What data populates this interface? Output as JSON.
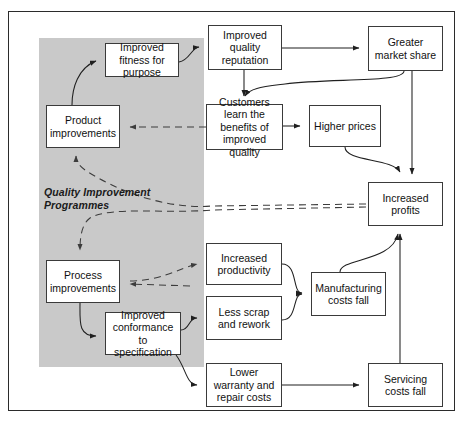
{
  "diagram": {
    "shaded_region_label": "Quality\nImprovement\nProgrammes",
    "shaded_region_label_lines": [
      "Quality",
      "Improvement",
      "Programmes"
    ],
    "colors": {
      "shaded_region": "#c9c9c9",
      "box_fill": "#ffffff",
      "box_border": "#3a3a3a",
      "frame_border": "#2b2b2b",
      "connector_solid": "#1f1f1f",
      "connector_dashed": "#3c3c3c"
    },
    "nodes": [
      {
        "id": "improved-fitness",
        "label": "Improved fitness for purpose",
        "lines": [
          "Improved fitness",
          "for purpose"
        ],
        "x": 105,
        "y": 43,
        "w": 74,
        "h": 34,
        "in_shaded_region": true
      },
      {
        "id": "product-improvements",
        "label": "Product improvements",
        "lines": [
          "Product",
          "improvements"
        ],
        "x": 46,
        "y": 105,
        "w": 74,
        "h": 43,
        "in_shaded_region": true
      },
      {
        "id": "process-improvements",
        "label": "Process improvements",
        "lines": [
          "Process",
          "improvements"
        ],
        "x": 46,
        "y": 260,
        "w": 74,
        "h": 43,
        "in_shaded_region": true
      },
      {
        "id": "improved-conformance",
        "label": "Improved conformance to specification",
        "lines": [
          "Improved",
          "conformance to",
          "specification"
        ],
        "x": 105,
        "y": 312,
        "w": 76,
        "h": 43,
        "in_shaded_region": true
      },
      {
        "id": "quality-reputation",
        "label": "Improved quality reputation",
        "lines": [
          "Improved",
          "quality",
          "reputation"
        ],
        "x": 208,
        "y": 25,
        "w": 74,
        "h": 45,
        "in_shaded_region": false
      },
      {
        "id": "customers-learn",
        "label": "Customers learn the benefits of improved quality",
        "lines": [
          "Customers learn",
          "the benefits of",
          "improved quality"
        ],
        "x": 206,
        "y": 104,
        "w": 77,
        "h": 46,
        "in_shaded_region": false
      },
      {
        "id": "higher-prices",
        "label": "Higher prices",
        "lines": [
          "Higher prices"
        ],
        "x": 309,
        "y": 105,
        "w": 72,
        "h": 42,
        "in_shaded_region": false
      },
      {
        "id": "greater-market-share",
        "label": "Greater market share",
        "lines": [
          "Greater",
          "market share"
        ],
        "x": 368,
        "y": 26,
        "w": 75,
        "h": 45,
        "in_shaded_region": false
      },
      {
        "id": "increased-profits",
        "label": "Increased profits",
        "lines": [
          "Increased",
          "profits"
        ],
        "x": 368,
        "y": 182,
        "w": 75,
        "h": 44,
        "in_shaded_region": false
      },
      {
        "id": "increased-productivity",
        "label": "Increased productivity",
        "lines": [
          "Increased",
          "productivity"
        ],
        "x": 206,
        "y": 243,
        "w": 76,
        "h": 42,
        "in_shaded_region": false
      },
      {
        "id": "less-scrap",
        "label": "Less scrap and rework",
        "lines": [
          "Less scrap and",
          "rework"
        ],
        "x": 206,
        "y": 296,
        "w": 76,
        "h": 44,
        "in_shaded_region": false
      },
      {
        "id": "lower-warranty",
        "label": "Lower warranty and repair costs",
        "lines": [
          "Lower warranty",
          "and repair",
          "costs"
        ],
        "x": 206,
        "y": 363,
        "w": 76,
        "h": 44,
        "in_shaded_region": false
      },
      {
        "id": "manufacturing-costs",
        "label": "Manufacturing costs fall",
        "lines": [
          "Manufacturing",
          "costs fall"
        ],
        "x": 311,
        "y": 272,
        "w": 75,
        "h": 44,
        "in_shaded_region": false
      },
      {
        "id": "servicing-costs",
        "label": "Servicing costs fall",
        "lines": [
          "Servicing",
          "costs fall"
        ],
        "x": 368,
        "y": 363,
        "w": 75,
        "h": 44,
        "in_shaded_region": false
      }
    ],
    "edges": [
      {
        "id": "e1",
        "from": "product-improvements",
        "to": "improved-fitness",
        "style": "solid"
      },
      {
        "id": "e2",
        "from": "improved-fitness",
        "to": "quality-reputation",
        "style": "solid"
      },
      {
        "id": "e3",
        "from": "quality-reputation",
        "to": "greater-market-share",
        "style": "solid"
      },
      {
        "id": "e4",
        "from": "quality-reputation",
        "to": "customers-learn",
        "style": "solid"
      },
      {
        "id": "e5",
        "from": "greater-market-share",
        "to": "customers-learn",
        "style": "solid"
      },
      {
        "id": "e6",
        "from": "customers-learn",
        "to": "higher-prices",
        "style": "solid"
      },
      {
        "id": "e7",
        "from": "greater-market-share",
        "to": "increased-profits",
        "style": "solid"
      },
      {
        "id": "e8",
        "from": "higher-prices",
        "to": "increased-profits",
        "style": "solid"
      },
      {
        "id": "e9",
        "from": "customers-learn",
        "to": "product-improvements",
        "style": "dashed"
      },
      {
        "id": "e10",
        "from": "increased-profits",
        "to": "product-improvements",
        "style": "dashed"
      },
      {
        "id": "e11",
        "from": "increased-profits",
        "to": "process-improvements",
        "style": "dashed"
      },
      {
        "id": "e12",
        "from": "process-improvements",
        "to": "increased-productivity",
        "style": "dashed"
      },
      {
        "id": "e13",
        "from": "process-improvements",
        "to": "improved-conformance",
        "style": "solid"
      },
      {
        "id": "e14",
        "from": "improved-conformance",
        "to": "less-scrap",
        "style": "solid"
      },
      {
        "id": "e15",
        "from": "improved-conformance",
        "to": "lower-warranty",
        "style": "solid"
      },
      {
        "id": "e16",
        "from": "increased-productivity",
        "to": "manufacturing-costs",
        "style": "solid"
      },
      {
        "id": "e17",
        "from": "less-scrap",
        "to": "manufacturing-costs",
        "style": "solid"
      },
      {
        "id": "e18",
        "from": "lower-warranty",
        "to": "servicing-costs",
        "style": "solid"
      },
      {
        "id": "e19",
        "from": "manufacturing-costs",
        "to": "increased-profits",
        "style": "solid"
      },
      {
        "id": "e20",
        "from": "servicing-costs",
        "to": "increased-profits",
        "style": "solid"
      }
    ]
  }
}
